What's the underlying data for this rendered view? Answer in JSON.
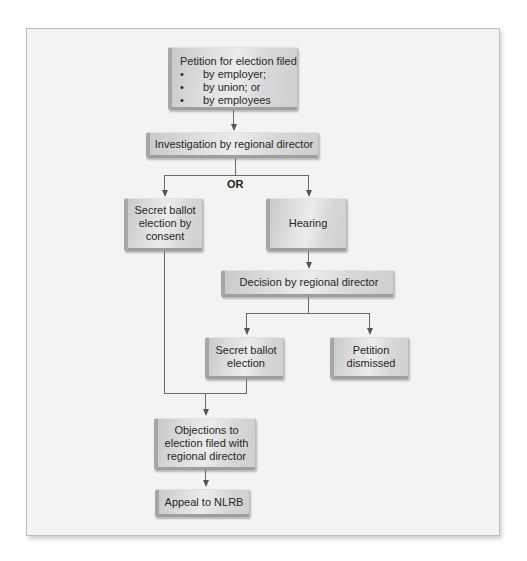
{
  "diagram": {
    "type": "flowchart",
    "nodes": {
      "petition": {
        "title": "Petition for election filed",
        "bullets": [
          "by employer;",
          "by union; or",
          "by employees"
        ]
      },
      "investigation": {
        "label": "Investigation by regional director"
      },
      "or_label": "OR",
      "secret_ballot_consent": {
        "label": "Secret ballot election by consent"
      },
      "hearing": {
        "label": "Hearing"
      },
      "decision": {
        "label": "Decision by regional director"
      },
      "secret_ballot_election": {
        "label": "Secret ballot election"
      },
      "petition_dismissed": {
        "label": "Petition dismissed"
      },
      "objections": {
        "label": "Objections to election filed with regional director"
      },
      "appeal": {
        "label": "Appeal to NLRB"
      }
    },
    "edges": [
      [
        "petition",
        "investigation"
      ],
      [
        "investigation",
        "secret_ballot_consent"
      ],
      [
        "investigation",
        "hearing"
      ],
      [
        "hearing",
        "decision"
      ],
      [
        "decision",
        "secret_ballot_election"
      ],
      [
        "decision",
        "petition_dismissed"
      ],
      [
        "secret_ballot_consent",
        "objections"
      ],
      [
        "secret_ballot_election",
        "objections"
      ],
      [
        "objections",
        "appeal"
      ]
    ],
    "colors": {
      "frame_bg": "#f3f3f2",
      "box_gradient_light": "#ececec",
      "box_gradient_dark": "#c9c9c9",
      "connector": "#6b6b6b",
      "text": "#262626"
    }
  }
}
